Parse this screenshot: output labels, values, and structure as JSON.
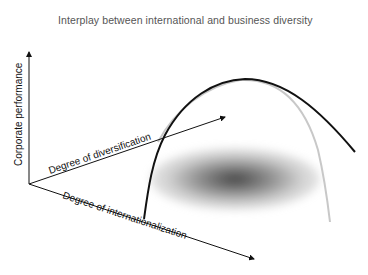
{
  "title": "Interplay between international and business diversity",
  "axes": {
    "vertical": {
      "label": "Corporate performance"
    },
    "depth": {
      "label": "Degree of diversification"
    },
    "horizontal": {
      "label": "Degree of internationalization"
    }
  },
  "curves": [
    {
      "name": "internationalization-performance-curve",
      "color": "#111111",
      "shape": "inverted-U"
    },
    {
      "name": "diversification-performance-curve",
      "color": "#c8c8c8",
      "shape": "inverted-U"
    }
  ],
  "regions": [
    {
      "name": "optimal-zone-shadow",
      "color": "#555555"
    }
  ]
}
